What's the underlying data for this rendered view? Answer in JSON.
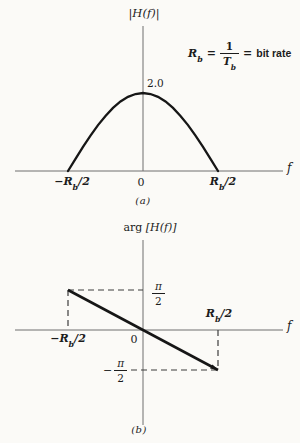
{
  "chart_data": [
    {
      "type": "line",
      "panel": "a",
      "title": "|H(f)|",
      "xlabel": "f",
      "ylabel": "|H(f)|",
      "x_units": "frequency in multiples of Rb (bit rate)",
      "x": [
        -0.5,
        -0.45,
        -0.4,
        -0.35,
        -0.3,
        -0.25,
        -0.2,
        -0.15,
        -0.1,
        -0.05,
        0,
        0.05,
        0.1,
        0.15,
        0.2,
        0.25,
        0.3,
        0.35,
        0.4,
        0.45,
        0.5
      ],
      "y": [
        0,
        0.313,
        0.618,
        0.908,
        1.176,
        1.414,
        1.618,
        1.782,
        1.902,
        1.975,
        2.0,
        1.975,
        1.902,
        1.782,
        1.618,
        1.414,
        1.176,
        0.908,
        0.618,
        0.313,
        0
      ],
      "peak_value": 2.0,
      "peak_label": "2.0",
      "xticks": [
        "-Rb/2",
        "0",
        "Rb/2"
      ],
      "xlim": [
        -0.893,
        0.933
      ],
      "ylim": [
        0,
        2.0
      ],
      "grid": false,
      "annotation": "Rb = 1/Tb = bit rate",
      "caption": "(a)"
    },
    {
      "type": "line",
      "panel": "b",
      "title": "arg [H(f)]",
      "xlabel": "f",
      "ylabel": "arg [H(f)]",
      "points": [
        [
          -0.5,
          1.5708
        ],
        [
          0.5,
          -1.5708
        ]
      ],
      "yticks": [
        "π/2",
        "−π/2"
      ],
      "xticks": [
        "-Rb/2",
        "0",
        "Rb/2"
      ],
      "xlim": [
        -0.853,
        0.933
      ],
      "ylim": [
        -1.5708,
        1.5708
      ],
      "grid": false,
      "guides": [
        [
          [
            -0.5,
            1.5708
          ],
          [
            0,
            1.5708
          ]
        ],
        [
          [
            -0.5,
            1.5708
          ],
          [
            -0.5,
            0
          ]
        ],
        [
          [
            0.5,
            0
          ],
          [
            0.5,
            -1.5708
          ]
        ],
        [
          [
            -0.08,
            -1.5708
          ],
          [
            0.5,
            -1.5708
          ]
        ]
      ],
      "caption": "(b)"
    }
  ],
  "labels": {
    "panel_a": {
      "title": "|H(f)|",
      "peak": "2.0",
      "minus": "−",
      "R": "R",
      "b": "b",
      "over2": "/2",
      "origin": "0",
      "axis": "f",
      "caption": "(a)",
      "annotation": {
        "R": "R",
        "b": "b",
        "eq1": "=",
        "one": "1",
        "T": "T",
        "eq2": "=",
        "text": "bit rate"
      }
    },
    "panel_b": {
      "title_fn": "arg",
      "title_arg": "[H(f)]",
      "pi": "π",
      "two": "2",
      "minus": "−",
      "R": "R",
      "b": "b",
      "over2": "/2",
      "origin": "0",
      "axis": "f",
      "caption": "(b)"
    }
  }
}
